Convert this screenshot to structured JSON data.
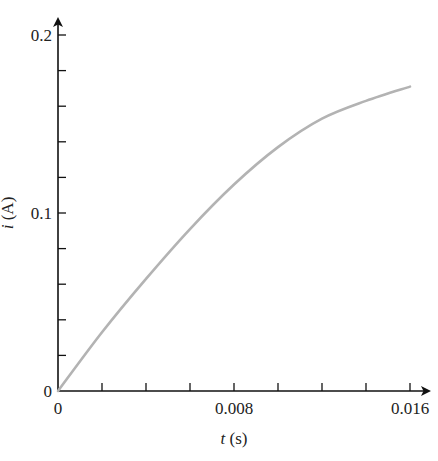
{
  "chart_data": {
    "type": "line",
    "title": "",
    "xlabel": "t (s)",
    "xlabel_var": "t",
    "xlabel_unit": "(s)",
    "ylabel": "i (A)",
    "ylabel_var": "i",
    "ylabel_unit": "(A)",
    "xlim": [
      0,
      0.016
    ],
    "ylim": [
      0,
      0.2
    ],
    "x_tick_labels": [
      "0",
      "0.008",
      "0.016"
    ],
    "y_tick_labels": [
      "0",
      "0.1",
      "0.2"
    ],
    "x_minor_ticks": [
      0.002,
      0.004,
      0.006,
      0.008,
      0.01,
      0.012,
      0.014,
      0.016
    ],
    "y_minor_ticks": [
      0.02,
      0.04,
      0.06,
      0.08,
      0.1,
      0.12,
      0.14,
      0.16,
      0.18,
      0.2
    ],
    "grid": false,
    "legend": null,
    "series": [
      {
        "name": "i(t)",
        "color": "#b3b3b3",
        "x": [
          0,
          0.002,
          0.004,
          0.006,
          0.008,
          0.01,
          0.012,
          0.014,
          0.016
        ],
        "values": [
          0,
          0.033,
          0.063,
          0.091,
          0.116,
          0.137,
          0.153,
          0.163,
          0.171
        ]
      }
    ]
  }
}
